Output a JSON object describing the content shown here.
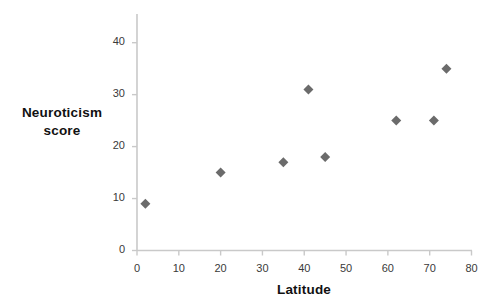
{
  "chart_data": {
    "type": "scatter",
    "title": "",
    "xlabel": "Latitude",
    "ylabel": "Neuroticism score",
    "ylabel_lines": [
      "Neuroticism",
      "score"
    ],
    "xlim": [
      0,
      80
    ],
    "ylim": [
      0,
      44
    ],
    "xticks": [
      0,
      10,
      20,
      30,
      40,
      50,
      60,
      70,
      80
    ],
    "xtick_labels": [
      "0",
      "10",
      "20",
      "30",
      "40",
      "50",
      "60",
      "70",
      "80"
    ],
    "yticks": [
      0,
      10,
      20,
      30,
      40
    ],
    "ytick_labels": [
      "0",
      "10",
      "20",
      "30",
      "40"
    ],
    "grid": false,
    "legend": false,
    "marker": "diamond",
    "marker_color": "#6b6b6b",
    "axis_color": "#c9c9c9",
    "points": [
      {
        "x": 2,
        "y": 9
      },
      {
        "x": 20,
        "y": 15
      },
      {
        "x": 35,
        "y": 17
      },
      {
        "x": 41,
        "y": 31
      },
      {
        "x": 45,
        "y": 18
      },
      {
        "x": 62,
        "y": 25
      },
      {
        "x": 71,
        "y": 25
      },
      {
        "x": 74,
        "y": 35
      }
    ],
    "series": [
      {
        "name": "Neuroticism score vs Latitude",
        "x": [
          2,
          20,
          35,
          41,
          45,
          62,
          71,
          74
        ],
        "values": [
          9,
          15,
          17,
          31,
          18,
          25,
          25,
          35
        ]
      }
    ]
  }
}
